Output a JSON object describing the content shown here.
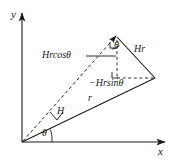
{
  "figure": {
    "kind": "vector-decomposition-diagram",
    "background_color": "#ffffff",
    "stroke_color": "#1a1a1a",
    "width": 176,
    "height": 164
  },
  "axes": {
    "x_label": "x",
    "y_label": "y",
    "origin": {
      "x": 22,
      "y": 142
    },
    "x_axis_end": {
      "x": 168,
      "y": 142
    },
    "y_axis_end": {
      "x": 22,
      "y": 10
    }
  },
  "vectors": {
    "r": {
      "label": "r",
      "style": "solid",
      "from": {
        "x": 22,
        "y": 142
      },
      "to": {
        "x": 155,
        "y": 78
      }
    },
    "Hr": {
      "label": "Hr",
      "style": "solid",
      "from": {
        "x": 117,
        "y": 35
      },
      "to": {
        "x": 155,
        "y": 78
      }
    },
    "H": {
      "label": "H",
      "style": "dashed",
      "from": {
        "x": 22,
        "y": 142
      },
      "to": {
        "x": 117,
        "y": 35
      }
    }
  },
  "components": {
    "vertical": {
      "label": "Hrcosθ",
      "description": "vertical component of Hr, drawn as dashed vertical segment"
    },
    "horizontal": {
      "label": "−Hrsinθ",
      "description": "horizontal component of Hr, drawn as dashed horizontal segment"
    }
  },
  "angles": {
    "origin_angle": {
      "label": "θ",
      "at": {
        "x": 45,
        "y": 133
      }
    },
    "tip_angle": {
      "label": "θ",
      "at": {
        "x": 115,
        "y": 52
      }
    }
  },
  "markers": {
    "right_angle_top": true,
    "right_angle_bottom": true,
    "tick_on_H": true
  }
}
